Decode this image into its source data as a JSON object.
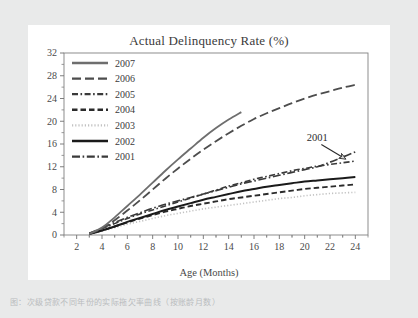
{
  "figure": {
    "title": "Actual Delinquency Rate (%)",
    "xlabel": "Age (Months)",
    "annotation_label": "2001",
    "caption": "图：次级贷款不同年份的实际拖欠率曲线（按账龄月数）"
  },
  "chart_data": {
    "type": "line",
    "title": "Actual Delinquency Rate (%)",
    "xlabel": "Age (Months)",
    "ylabel": "",
    "xlim": [
      1,
      25
    ],
    "ylim": [
      0,
      32
    ],
    "xticks": [
      2,
      4,
      6,
      8,
      10,
      12,
      14,
      16,
      18,
      20,
      22,
      24
    ],
    "yticks": [
      0,
      4,
      8,
      12,
      16,
      20,
      24,
      28,
      32
    ],
    "minor_ticks": true,
    "grid": false,
    "legend_position": "top-left",
    "annotations": [
      {
        "text": "2001",
        "x": 21.0,
        "y": 16.6,
        "arrow_to_x": 23.2,
        "arrow_to_y": 13.4
      }
    ],
    "series": [
      {
        "name": "2007",
        "color": "#6e6e6e",
        "dash": "solid",
        "width": 1.8,
        "x": [
          3,
          4,
          5,
          6,
          7,
          8,
          9,
          10,
          11,
          12,
          13,
          14,
          15
        ],
        "values": [
          0.2,
          1.3,
          3.1,
          5.1,
          7.1,
          9.2,
          11.3,
          13.3,
          15.2,
          17.1,
          18.8,
          20.3,
          21.6
        ]
      },
      {
        "name": "2006",
        "color": "#4d4d4d",
        "dash": "long-dash",
        "width": 1.8,
        "x": [
          3,
          4,
          5,
          6,
          7,
          8,
          9,
          10,
          11,
          12,
          13,
          14,
          15,
          16,
          17,
          18,
          19,
          20,
          21,
          22,
          23,
          24
        ],
        "values": [
          0.2,
          1.1,
          2.6,
          4.3,
          6.1,
          8.0,
          9.9,
          11.7,
          13.4,
          15.0,
          16.5,
          17.9,
          19.2,
          20.4,
          21.4,
          22.3,
          23.2,
          24.0,
          24.7,
          25.3,
          25.9,
          26.4
        ]
      },
      {
        "name": "2005",
        "color": "#3a3a3a",
        "dash": "dash-dot",
        "width": 1.6,
        "x": [
          3,
          4,
          5,
          6,
          7,
          8,
          9,
          10,
          11,
          12,
          13,
          14,
          15,
          16,
          17,
          18,
          19,
          20,
          21,
          22,
          23,
          24
        ],
        "values": [
          0.3,
          1.1,
          2.0,
          2.9,
          3.7,
          4.4,
          5.1,
          5.8,
          6.5,
          7.2,
          7.9,
          8.6,
          9.2,
          9.8,
          10.3,
          10.8,
          11.3,
          11.7,
          12.1,
          12.4,
          12.7,
          13.0
        ]
      },
      {
        "name": "2004",
        "color": "#2b2b2b",
        "dash": "dash",
        "width": 1.9,
        "x": [
          3,
          4,
          5,
          6,
          7,
          8,
          9,
          10,
          11,
          12,
          13,
          14,
          15,
          16,
          17,
          18,
          19,
          20,
          21,
          22,
          23,
          24
        ],
        "values": [
          0.2,
          0.8,
          1.5,
          2.2,
          2.9,
          3.5,
          4.1,
          4.6,
          5.1,
          5.5,
          5.9,
          6.3,
          6.6,
          6.9,
          7.2,
          7.5,
          7.8,
          8.1,
          8.3,
          8.5,
          8.7,
          8.9
        ]
      },
      {
        "name": "2003",
        "color": "#c2c2c2",
        "dash": "dot",
        "width": 1.6,
        "x": [
          3,
          4,
          5,
          6,
          7,
          8,
          9,
          10,
          11,
          12,
          13,
          14,
          15,
          16,
          17,
          18,
          19,
          20,
          21,
          22,
          23,
          24
        ],
        "values": [
          0.2,
          0.7,
          1.3,
          1.9,
          2.4,
          2.9,
          3.4,
          3.8,
          4.2,
          4.6,
          4.9,
          5.2,
          5.5,
          5.8,
          6.1,
          6.4,
          6.6,
          6.9,
          7.1,
          7.3,
          7.4,
          7.5
        ]
      },
      {
        "name": "2002",
        "color": "#1a1a1a",
        "dash": "solid",
        "width": 2.0,
        "x": [
          3,
          4,
          5,
          6,
          7,
          8,
          9,
          10,
          11,
          12,
          13,
          14,
          15,
          16,
          17,
          18,
          19,
          20,
          21,
          22,
          23,
          24
        ],
        "values": [
          0.2,
          0.8,
          1.5,
          2.3,
          3.0,
          3.7,
          4.4,
          5.0,
          5.6,
          6.2,
          6.7,
          7.2,
          7.7,
          8.1,
          8.5,
          8.8,
          9.1,
          9.4,
          9.6,
          9.8,
          10.0,
          10.2
        ]
      },
      {
        "name": "2001",
        "color": "#3a3a3a",
        "dash": "dash-dot-long",
        "width": 1.7,
        "x": [
          3,
          4,
          5,
          6,
          7,
          8,
          9,
          10,
          11,
          12,
          13,
          14,
          15,
          16,
          17,
          18,
          19,
          20,
          21,
          22,
          23,
          24
        ],
        "values": [
          0.3,
          1.2,
          2.2,
          3.1,
          3.9,
          4.7,
          5.4,
          6.0,
          6.6,
          7.2,
          7.8,
          8.4,
          9.0,
          9.5,
          10.0,
          10.5,
          11.0,
          11.5,
          12.0,
          12.8,
          13.7,
          14.6
        ]
      }
    ],
    "legend_entries": [
      "2007",
      "2006",
      "2005",
      "2004",
      "2003",
      "2002",
      "2001"
    ]
  }
}
